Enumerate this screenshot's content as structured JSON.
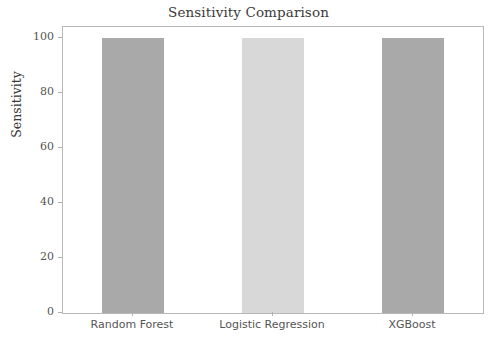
{
  "chart_data": {
    "type": "bar",
    "title": "Sensitivity Comparison",
    "xlabel": "",
    "ylabel": "Sensitivity",
    "categories": [
      "Random Forest",
      "Logistic Regression",
      "XGBoost"
    ],
    "values": [
      100,
      100,
      100
    ],
    "series": [
      {
        "name": "Sensitivity",
        "values": [
          100,
          100,
          100
        ]
      }
    ],
    "bar_colors": [
      "#a9a9a9",
      "#d8d8d8",
      "#a9a9a9"
    ],
    "ylim": [
      0,
      104
    ],
    "yticks": [
      0,
      20,
      40,
      60,
      80,
      100
    ],
    "ytick_labels": [
      "0",
      "20",
      "40",
      "60",
      "80",
      "100"
    ],
    "grid": false,
    "legend": false,
    "legend_position": "none",
    "frame_color": "#b8b8b8",
    "background": "#ffffff",
    "text_color": "#3a3a3a",
    "tick_color": "#555555"
  }
}
